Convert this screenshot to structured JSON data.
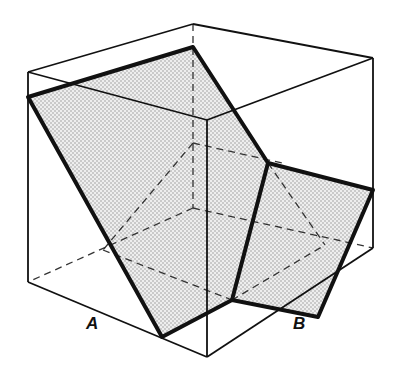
{
  "diagram": {
    "type": "cube-cross-section",
    "colors": {
      "line": "#111111",
      "fill": "#d9d9d9",
      "dot": "#8a8a8a",
      "background": "#ffffff"
    },
    "labels": {
      "a": "A",
      "b": "B"
    }
  }
}
